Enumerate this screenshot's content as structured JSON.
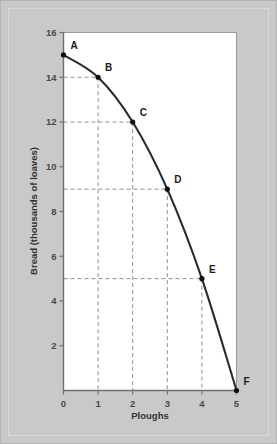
{
  "figure": {
    "background_color": "#c9c9c9",
    "plot_background_color": "#ffffff",
    "frame_border_color": "#b4b4b4"
  },
  "chart_data": {
    "type": "line",
    "title": "",
    "subtitle": "",
    "xlabel": "Ploughs",
    "ylabel": "Bread (thousands of loaves)",
    "xlim": [
      0,
      5
    ],
    "ylim": [
      0,
      16
    ],
    "xticks": [
      "0",
      "1",
      "2",
      "3",
      "4",
      "5"
    ],
    "yticks": [
      "2",
      "4",
      "6",
      "8",
      "10",
      "12",
      "14",
      "16"
    ],
    "xtick_values": [
      0,
      1,
      2,
      3,
      4,
      5
    ],
    "ytick_values": [
      2,
      4,
      6,
      8,
      10,
      12,
      14,
      16
    ],
    "grid": false,
    "legend": null,
    "curve_color": "#2b2b2b",
    "guideline_color": "#8c8c8c",
    "guideline_style": "dashed",
    "x": [
      0,
      1,
      2,
      3,
      4,
      5
    ],
    "values": [
      15,
      14,
      12,
      9,
      5,
      0
    ],
    "series": [
      {
        "name": "Production possibilities frontier",
        "values": [
          15,
          14,
          12,
          9,
          5,
          0
        ]
      }
    ],
    "points": [
      {
        "label": "A",
        "x": 0,
        "y": 15,
        "label_dx": 7,
        "label_dy": -6
      },
      {
        "label": "B",
        "x": 1,
        "y": 14,
        "label_dx": 7,
        "label_dy": -6
      },
      {
        "label": "C",
        "x": 2,
        "y": 12,
        "label_dx": 7,
        "label_dy": -6
      },
      {
        "label": "D",
        "x": 3,
        "y": 9,
        "label_dx": 7,
        "label_dy": -6
      },
      {
        "label": "E",
        "x": 4,
        "y": 5,
        "label_dx": 7,
        "label_dy": -6
      },
      {
        "label": "F",
        "x": 5,
        "y": 0,
        "label_dx": 7,
        "label_dy": -6
      }
    ],
    "annotations": []
  }
}
